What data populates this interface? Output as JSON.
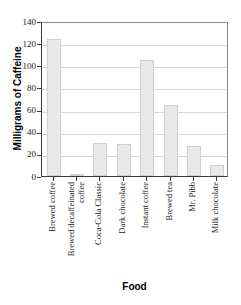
{
  "chart_data": {
    "type": "bar",
    "title": "",
    "xlabel": "Food",
    "ylabel": "Milligrams of Caffeine",
    "categories": [
      "Brewed coffee",
      "Brewed decaffeinated coffee",
      "Coca-Cola Classic",
      "Dark chocolate",
      "Instant coffee",
      "Brewed tea",
      "Mr. Pibb",
      "Milk chocolate"
    ],
    "values": [
      124,
      2,
      30,
      29,
      105,
      64,
      27,
      10
    ],
    "ylim": [
      0,
      140
    ],
    "ytick_step": 20,
    "yticks": [
      0,
      20,
      40,
      60,
      80,
      100,
      120,
      140
    ],
    "ytick_labels": [
      "0",
      "20",
      "40",
      "60",
      "80",
      "100",
      "120",
      "140"
    ],
    "grid": true,
    "grid_axis": "y",
    "legend": false,
    "bar_color": "#e9e9e9",
    "bar_edge_color": "#cfcfcf",
    "axis_color": "#3a3a3a",
    "grid_color": "#d5d5d5"
  }
}
